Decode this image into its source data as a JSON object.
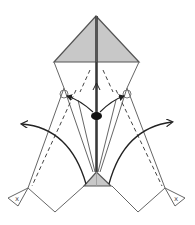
{
  "diagram": {
    "type": "origami-fold-step",
    "colors": {
      "paper_back": "#c8c8c8",
      "line": "#666666",
      "thick_line": "#3a3a3a",
      "arrow": "#222222",
      "background": "#ffffff"
    },
    "elements": {
      "top_flap": "shaded kite flap",
      "center_crease": "thick vertical center line",
      "bottom_flap": "small shaded triangle",
      "pivot_marks": [
        "left circle",
        "right circle"
      ],
      "fold_arrows": [
        "left swing arrow",
        "right swing arrow"
      ],
      "hinge_marks": [
        "left x-mark",
        "right x-mark"
      ],
      "hold_point": "black dot on center line"
    },
    "markers": {
      "left_x": "x",
      "right_x": "x"
    }
  }
}
